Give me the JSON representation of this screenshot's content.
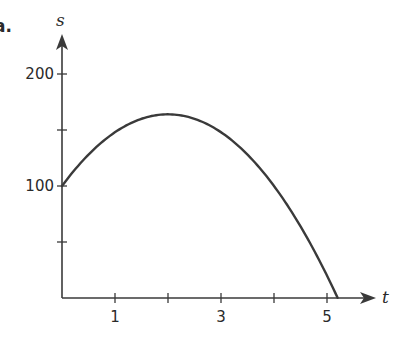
{
  "part_label": "a.",
  "chart_data": {
    "type": "line",
    "title": "",
    "xlabel": "t",
    "ylabel": "s",
    "xlim": [
      0,
      5.6
    ],
    "ylim": [
      0,
      210
    ],
    "x_ticks": [
      1,
      2,
      3,
      4,
      5
    ],
    "x_tick_labels": [
      "1",
      "",
      "3",
      "",
      "5"
    ],
    "y_ticks": [
      50,
      100,
      150,
      200
    ],
    "y_tick_labels": [
      "",
      "100",
      "",
      "200"
    ],
    "grid": false,
    "legend": null,
    "series": [
      {
        "name": "s(t)",
        "description": "Downward parabola, approx s = -16t^2 + 64t + 100",
        "x": [
          0,
          0.5,
          1,
          1.5,
          2,
          2.5,
          3,
          3.5,
          4,
          4.5,
          5,
          5.2
        ],
        "values": [
          100,
          128,
          148,
          160,
          164,
          160,
          148,
          128,
          100,
          64,
          20,
          0
        ]
      }
    ],
    "line_color": "#3a3a3a"
  }
}
